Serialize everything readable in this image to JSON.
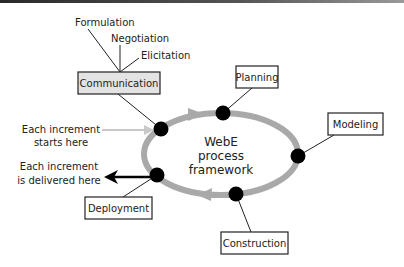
{
  "diagram": {
    "center_label": [
      "WebE",
      "process",
      "framework"
    ],
    "activities": {
      "communication": "Communication",
      "planning": "Planning",
      "modeling": "Modeling",
      "construction": "Construction",
      "deployment": "Deployment"
    },
    "communication_subtasks": [
      "Formulation",
      "Negotiation",
      "Elicitation"
    ],
    "increment_start": [
      "Each increment",
      "starts here"
    ],
    "increment_delivered": [
      "Each increment",
      "is delivered here"
    ],
    "colors": {
      "loop": "#a9a9a9",
      "node": "#000000",
      "communication_fill": "#e3e3e3",
      "start_arrow": "#c8c8c8",
      "deliver_arrow": "#000000"
    }
  }
}
